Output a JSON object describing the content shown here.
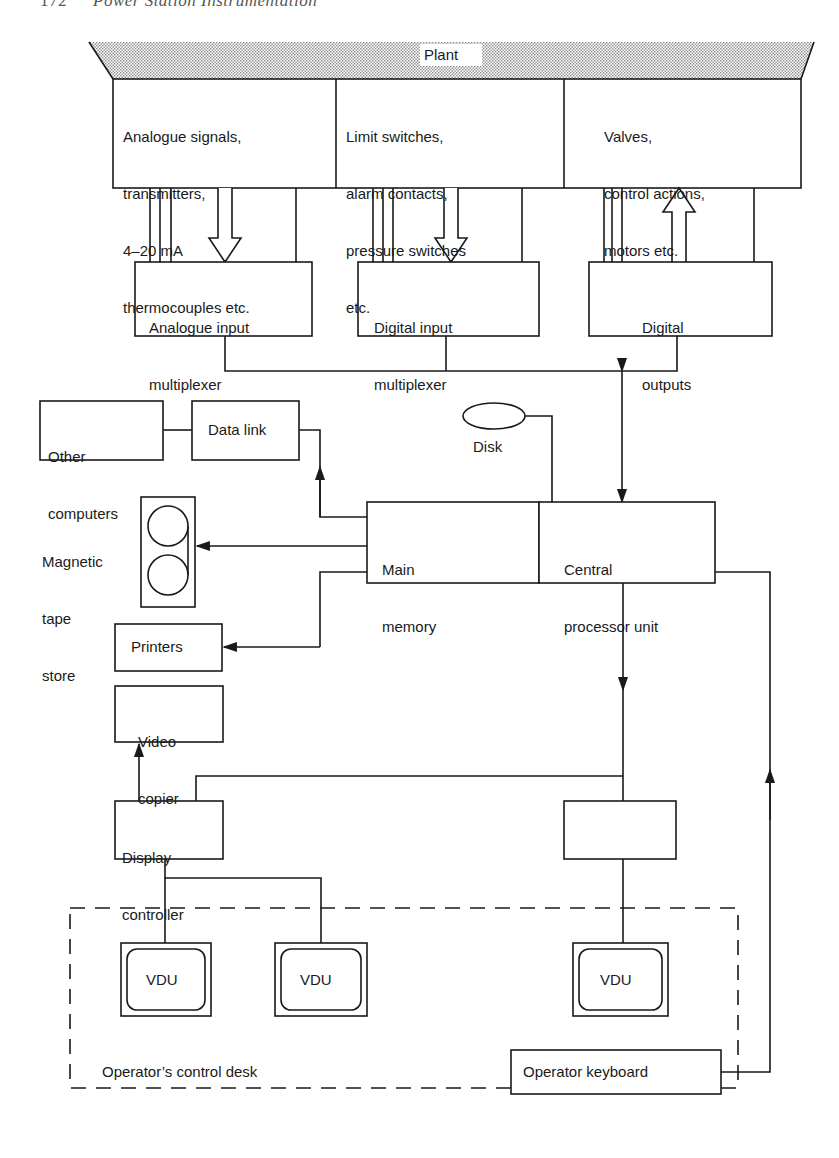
{
  "page_header": {
    "number": "172",
    "title": "Power Station Instrumentation"
  },
  "plant": {
    "title": "Plant",
    "sections": [
      {
        "id": "analogue",
        "lines": [
          "Analogue signals,",
          "transmitters,",
          "4–20 mA",
          "thermocouples etc."
        ]
      },
      {
        "id": "limit",
        "lines": [
          "Limit switches,",
          "alarm contacts,",
          "pressure switches",
          "etc."
        ]
      },
      {
        "id": "valves",
        "lines": [
          "Valves,",
          "control actions,",
          "motors etc."
        ]
      }
    ]
  },
  "io_blocks": [
    {
      "id": "analogue_mux",
      "lines": [
        "Analogue input",
        "multiplexer"
      ]
    },
    {
      "id": "digital_mux",
      "lines": [
        "Digital input",
        "multiplexer"
      ]
    },
    {
      "id": "digital_out",
      "lines": [
        "Digital",
        "outputs"
      ]
    }
  ],
  "peripherals": {
    "other_computers": [
      "Other",
      "computers"
    ],
    "data_link": "Data link",
    "disk": "Disk",
    "magnetic_tape": [
      "Magnetic",
      "tape",
      "store"
    ],
    "printers": "Printers",
    "video_copier": [
      "Video",
      "copier"
    ],
    "display_controller": [
      "Display",
      "controller"
    ],
    "keyboard_interface": ""
  },
  "core": {
    "main_memory": [
      "Main",
      "memory"
    ],
    "cpu": [
      "Central",
      "processor unit"
    ]
  },
  "control_desk": {
    "label": "Operator’s control desk",
    "vdus": [
      "VDU",
      "VDU",
      "VDU"
    ],
    "keyboard": "Operator keyboard"
  },
  "colors": {
    "line": "#1a1a1a",
    "background": "#ffffff",
    "stipple": "#9a9a9a"
  }
}
